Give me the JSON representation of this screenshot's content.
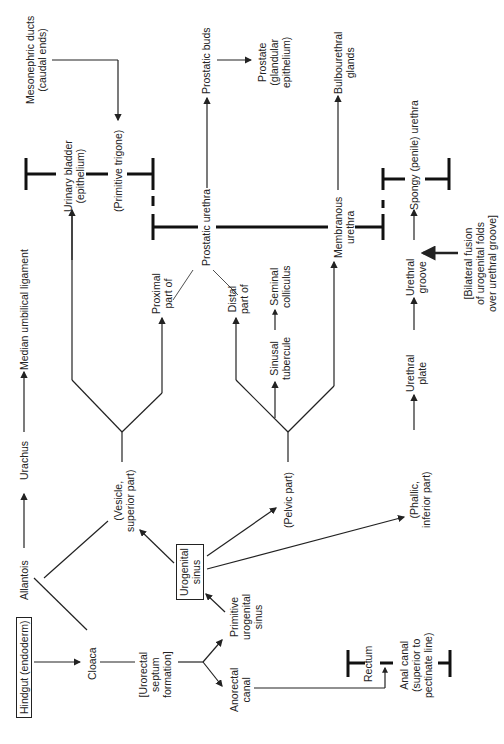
{
  "diagram": {
    "orientation": "rotated -90deg",
    "nodes": {
      "hindgut": "Hindgut (endoderm)",
      "cloaca": "Cloaca",
      "allantois": "Allantois",
      "urachus": "Urachus",
      "median_umbilical": "Median umbilical ligament",
      "urorectal": [
        "[Urorectal",
        "septum",
        "formation]"
      ],
      "primitive_ug_sinus": [
        "Primitive",
        "urogenital",
        "sinus"
      ],
      "anorectal_canal": [
        "Anorectal",
        "canal"
      ],
      "ug_sinus": [
        "Urogenital",
        "sinus"
      ],
      "vesicle": [
        "(Vesicle,",
        "superior part)"
      ],
      "pelvic": "(Pelvic part)",
      "phallic": [
        "(Phallic,",
        "inferior part)"
      ],
      "rectum": "Rectum",
      "anal_canal": [
        "Anal canal",
        "(superior to",
        "pectinate line)"
      ],
      "urinary_bladder": [
        "Urinary bladder",
        "(epithelium)"
      ],
      "primitive_trigone": "(Primitive trigone)",
      "mesonephric": [
        "Mesonephric ducts",
        "(caudal ends)"
      ],
      "proximal_part": [
        "Proximal",
        "part of"
      ],
      "distal_part": [
        "Distal",
        "part of"
      ],
      "prostatic_urethra": "Prostatic urethra",
      "sinusal_tubercule": [
        "Sinusal",
        "tubercule"
      ],
      "seminal_colliculus": [
        "Seminal",
        "colliculus"
      ],
      "prostatic_buds": "Prostatic buds",
      "prostate": [
        "Prostate",
        "(glandular",
        "epithelium)"
      ],
      "membranous_urethra": [
        "Membranous",
        "urethra"
      ],
      "bulbourethral": [
        "Bulbourethral",
        "glands"
      ],
      "urethral_plate": [
        "Urethral",
        "plate"
      ],
      "urethral_groove": [
        "Urethral",
        "groove"
      ],
      "spongy_urethra": "Spongy (penile) urethra",
      "bilateral_fusion": [
        "[Bilateral fusion",
        "of urogenital folds",
        "over urethral groove]"
      ]
    }
  }
}
